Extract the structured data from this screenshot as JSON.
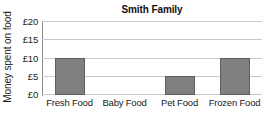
{
  "chart_data": {
    "type": "bar",
    "title": "Smith Family",
    "xlabel": "",
    "ylabel": "Money spent on food",
    "categories": [
      "Fresh Food",
      "Baby Food",
      "Pet Food",
      "Frozen Food"
    ],
    "values": [
      10,
      0,
      5,
      10
    ],
    "ytick_labels": [
      "£0",
      "£5",
      "£10",
      "£15",
      "£20"
    ],
    "ytick_values": [
      0,
      5,
      10,
      15,
      20
    ],
    "ylim": [
      0,
      20
    ],
    "grid": "horizontal",
    "legend": "none",
    "currency_symbol": "£",
    "bar_color": "#808080",
    "bar_border_color": "#5e5e5e",
    "gridline_color": "#c9c9c9",
    "axis_color": "#8c8c8c",
    "background_color": "#ffffff"
  }
}
